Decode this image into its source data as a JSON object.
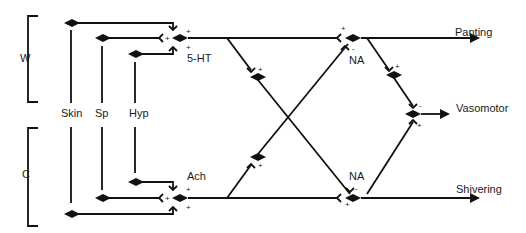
{
  "diagram": {
    "title": "",
    "groups": [
      {
        "id": "W",
        "label": "W"
      },
      {
        "id": "C",
        "label": "C"
      }
    ],
    "inputs": [
      {
        "id": "skin",
        "label": "Skin"
      },
      {
        "id": "sp",
        "label": "Sp"
      },
      {
        "id": "hyp",
        "label": "Hyp"
      }
    ],
    "transmitters": [
      {
        "id": "5ht",
        "label": "5-HT"
      },
      {
        "id": "ach",
        "label": "Ach"
      },
      {
        "id": "na_top",
        "label": "NA"
      },
      {
        "id": "na_bottom",
        "label": "NA"
      }
    ],
    "outputs": [
      {
        "id": "panting",
        "label": "Panting"
      },
      {
        "id": "vasomotor",
        "label": "Vasomotor"
      },
      {
        "id": "shivering",
        "label": "Shivering"
      }
    ],
    "signs": {
      "plus": "+",
      "minus": "-"
    }
  }
}
